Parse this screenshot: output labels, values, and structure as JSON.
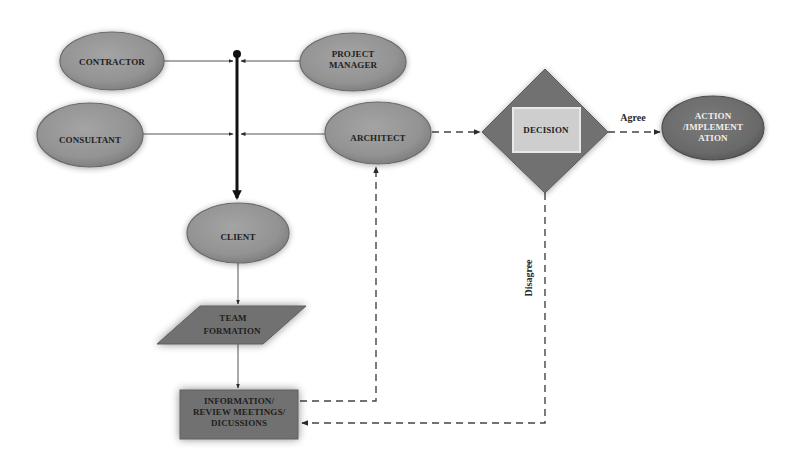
{
  "diagram": {
    "nodes": {
      "contractor": {
        "label_lines": [
          "CONTRACTOR"
        ],
        "shape": "ellipse"
      },
      "project_manager": {
        "label_lines": [
          "PROJECT",
          "MANAGER"
        ],
        "shape": "ellipse"
      },
      "consultant": {
        "label_lines": [
          "CONSULTANT"
        ],
        "shape": "ellipse"
      },
      "architect": {
        "label_lines": [
          "ARCHITECT"
        ],
        "shape": "ellipse"
      },
      "decision": {
        "label_lines": [
          "DECISION"
        ],
        "shape": "diamond"
      },
      "action": {
        "label_lines": [
          "ACTION",
          "/IMPLEMENT",
          "ATION"
        ],
        "shape": "ellipse"
      },
      "client": {
        "label_lines": [
          "CLIENT"
        ],
        "shape": "ellipse"
      },
      "team_formation": {
        "label_lines": [
          "TEAM",
          "FORMATION"
        ],
        "shape": "parallelogram"
      },
      "information": {
        "label_lines": [
          "INFORMATION/",
          "REVIEW MEETINGS/",
          "DICUSSIONS"
        ],
        "shape": "rectangle"
      }
    },
    "edges": [
      {
        "from": "contractor",
        "to": "bus",
        "style": "solid"
      },
      {
        "from": "project_manager",
        "to": "bus",
        "style": "solid"
      },
      {
        "from": "consultant",
        "to": "bus",
        "style": "solid"
      },
      {
        "from": "architect",
        "to": "bus",
        "style": "solid"
      },
      {
        "from": "bus",
        "to": "client",
        "style": "bold"
      },
      {
        "from": "client",
        "to": "team_formation",
        "style": "solid"
      },
      {
        "from": "team_formation",
        "to": "information",
        "style": "solid"
      },
      {
        "from": "information",
        "to": "architect",
        "style": "dashed"
      },
      {
        "from": "architect",
        "to": "decision",
        "style": "dashed"
      },
      {
        "from": "decision",
        "to": "action",
        "style": "dashed",
        "label": "Agree"
      },
      {
        "from": "decision",
        "to": "information",
        "style": "dashed",
        "label": "Disagree"
      }
    ],
    "edge_labels": {
      "agree": "Agree",
      "disagree": "Disagree"
    },
    "colors": {
      "ellipse_fill": "#959595",
      "ellipse_stroke": "#6a6a6a",
      "dark_fill": "#707070",
      "action_fill": "#6c6c6c",
      "decision_box_fill": "#cdcdcd",
      "line": "#3a3a3a"
    }
  }
}
